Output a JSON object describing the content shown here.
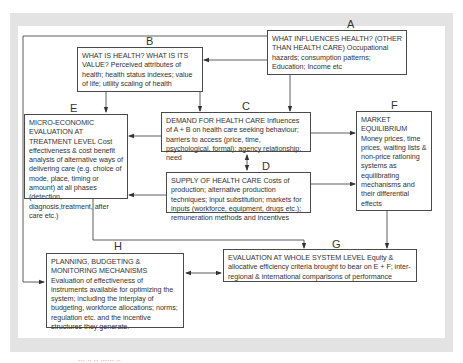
{
  "diagram": {
    "nodes": [
      {
        "id": "A",
        "label": "A",
        "heading": "WHAT INFLUENCES HEALTH? (OTHER THAN HEALTH CARE)",
        "body": "Occupational hazards; consumption patterns; Education; Income etc"
      },
      {
        "id": "B",
        "label": "B",
        "heading": "WHAT IS HEALTH? WHAT IS ITS VALUE?",
        "body": "Perceived attributes of health; health status indexes; value of life; utility scaling of health"
      },
      {
        "id": "C",
        "label": "C",
        "heading": "DEMAND FOR HEALTH CARE",
        "body": "Influences of A + B on health care seeking behaviour; barriers to access (price, time, psychological, formal); agency relationship; need"
      },
      {
        "id": "D",
        "label": "D",
        "heading": "SUPPLY OF HEALTH CARE",
        "body": "Costs of production; alternative production techniques; input substitution; markets for inputs (workforce, equipment, drugs etc.); remuneration methods and incentives"
      },
      {
        "id": "E",
        "label": "E",
        "heading": "MICRO-ECONOMIC EVALUATION AT TREATMENT LEVEL",
        "body": "Cost effectiveness & cost benefit analysis of alternative ways of delivering care (e.g. choice of mode, place, timing or amount) at all phases (detection, diagnosis,treatment, after care etc.)"
      },
      {
        "id": "F",
        "label": "F",
        "heading": "MARKET EQUILIBRIUM",
        "body": "Money prices, time prices, waiting lists & non-price rationing systems as equilibrating mechanisms and their differential effects"
      },
      {
        "id": "G",
        "label": "G",
        "heading": "EVALUATION AT WHOLE SYSTEM LEVEL",
        "body": "Equity & allocative efficiency criteria brought to bear on E + F; inter-regional & international comparisons of performance"
      },
      {
        "id": "H",
        "label": "H",
        "heading": "PLANNING, BUDGETING & MONITORING MECHANISMS",
        "body": "Evaluation of effectiveness of instruments available for optimizing the system; including the interplay of budgeting, workforce allocations; norms; regulation etc. and the incentive structures they generate."
      }
    ],
    "edges": [
      {
        "from": "A",
        "to": "B"
      },
      {
        "from": "A",
        "to": "C"
      },
      {
        "from": "A",
        "to": "H"
      },
      {
        "from": "B",
        "to": "E"
      },
      {
        "from": "B",
        "to": "C"
      },
      {
        "from": "C",
        "to": "E"
      },
      {
        "from": "C",
        "to": "F"
      },
      {
        "from": "C",
        "to": "D",
        "bidirectional": true
      },
      {
        "from": "D",
        "to": "E"
      },
      {
        "from": "D",
        "to": "F"
      },
      {
        "from": "E",
        "to": "G"
      },
      {
        "from": "F",
        "to": "G"
      },
      {
        "from": "H",
        "to": "G",
        "bidirectional": true
      }
    ],
    "colors": {
      "frame": "#e3e3e3",
      "line": "#4a4a4a",
      "text": "#333333"
    }
  },
  "caption": "··· ·· ·· ······ ··"
}
